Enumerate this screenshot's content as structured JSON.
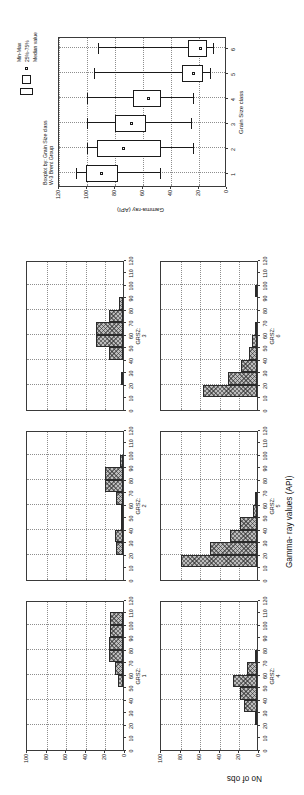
{
  "figure": {
    "orientation": "landscape figure rendered rotated 90 degrees counter-clockwise"
  },
  "histograms": {
    "shared_x_axis_title": "Gamma- ray values (API)",
    "shared_y_axis_title": "No of obs",
    "x_ticks": [
      "0",
      "10",
      "20",
      "30",
      "40",
      "50",
      "60",
      "70",
      "80",
      "90",
      "100",
      "110",
      "120"
    ],
    "y_ticks": [
      "0",
      "20",
      "40",
      "60",
      "80",
      "100"
    ],
    "panels": [
      {
        "label_line1": "GRSZ:",
        "label_line2": "1",
        "name": "grsz-1"
      },
      {
        "label_line1": "GRSZ:",
        "label_line2": "2",
        "name": "grsz-2"
      },
      {
        "label_line1": "GRSZ:",
        "label_line2": "3",
        "name": "grsz-3"
      },
      {
        "label_line1": "GRSZ:",
        "label_line2": "4",
        "name": "grsz-4"
      },
      {
        "label_line1": "GRSZ:",
        "label_line2": "5",
        "name": "grsz-5"
      },
      {
        "label_line1": "GRSZ:",
        "label_line2": "6",
        "name": "grsz-6"
      }
    ]
  },
  "boxplot": {
    "title_line1": "Boxplot by: Grain Size class",
    "title_line2": "W-3 Brent Group",
    "y_axis_title": "Gamma-ray (API)",
    "x_axis_title": "Grain Size class",
    "y_ticks": [
      "0",
      "20",
      "40",
      "60",
      "80",
      "100",
      "120"
    ],
    "x_ticks": [
      "1",
      "2",
      "3",
      "4",
      "5",
      "6"
    ],
    "legend": {
      "minmax_label": "Min-Max",
      "iqr_label": "25%-75%",
      "median_label": "Median value"
    }
  },
  "chart_data": [
    {
      "type": "bar",
      "name": "grsz-1",
      "title": "GRSZ: 1",
      "xlabel": "Gamma- ray values (API)",
      "ylabel": "No of obs",
      "xlim": [
        0,
        120
      ],
      "ylim": [
        0,
        100
      ],
      "grid": true,
      "bin_width": 10,
      "bin_starts": [
        0,
        10,
        20,
        30,
        40,
        50,
        60,
        70,
        80,
        90,
        100,
        110
      ],
      "categories": [
        "0-10",
        "10-20",
        "20-30",
        "30-40",
        "40-50",
        "50-60",
        "60-70",
        "70-80",
        "80-90",
        "90-100",
        "100-110",
        "110-120"
      ],
      "values": [
        0,
        0,
        0,
        0,
        0,
        5,
        8,
        14,
        14,
        13,
        13,
        0
      ]
    },
    {
      "type": "bar",
      "name": "grsz-2",
      "title": "GRSZ: 2",
      "xlabel": "Gamma- ray values (API)",
      "ylabel": "No of obs",
      "xlim": [
        0,
        120
      ],
      "ylim": [
        0,
        100
      ],
      "grid": true,
      "bin_width": 10,
      "bin_starts": [
        0,
        10,
        20,
        30,
        40,
        50,
        60,
        70,
        80,
        90,
        100,
        110
      ],
      "categories": [
        "0-10",
        "10-20",
        "20-30",
        "30-40",
        "40-50",
        "50-60",
        "60-70",
        "70-80",
        "80-90",
        "90-100",
        "100-110",
        "110-120"
      ],
      "values": [
        0,
        0,
        7,
        8,
        1,
        2,
        7,
        18,
        18,
        3,
        0,
        0
      ]
    },
    {
      "type": "bar",
      "name": "grsz-3",
      "title": "GRSZ: 3",
      "xlabel": "Gamma- ray values (API)",
      "ylabel": "No of obs",
      "xlim": [
        0,
        120
      ],
      "ylim": [
        0,
        100
      ],
      "grid": true,
      "bin_width": 10,
      "bin_starts": [
        0,
        10,
        20,
        30,
        40,
        50,
        60,
        70,
        80,
        90,
        100,
        110
      ],
      "categories": [
        "0-10",
        "10-20",
        "20-30",
        "30-40",
        "40-50",
        "50-60",
        "60-70",
        "70-80",
        "80-90",
        "90-100",
        "100-110",
        "110-120"
      ],
      "values": [
        0,
        0,
        2,
        0,
        14,
        28,
        28,
        14,
        4,
        0,
        0,
        0
      ]
    },
    {
      "type": "bar",
      "name": "grsz-4",
      "title": "GRSZ: 4",
      "xlabel": "Gamma- ray values (API)",
      "ylabel": "No of obs",
      "xlim": [
        0,
        120
      ],
      "ylim": [
        0,
        100
      ],
      "grid": true,
      "bin_width": 10,
      "bin_starts": [
        0,
        10,
        20,
        30,
        40,
        50,
        60,
        70,
        80,
        90,
        100,
        110
      ],
      "categories": [
        "0-10",
        "10-20",
        "20-30",
        "30-40",
        "40-50",
        "50-60",
        "60-70",
        "70-80",
        "80-90",
        "90-100",
        "100-110",
        "110-120"
      ],
      "values": [
        0,
        0,
        2,
        13,
        17,
        25,
        10,
        2,
        0,
        0,
        0,
        0
      ]
    },
    {
      "type": "bar",
      "name": "grsz-5",
      "title": "GRSZ: 5",
      "xlabel": "Gamma- ray values (API)",
      "ylabel": "No of obs",
      "xlim": [
        0,
        120
      ],
      "ylim": [
        0,
        100
      ],
      "grid": true,
      "bin_width": 10,
      "bin_starts": [
        0,
        10,
        20,
        30,
        40,
        50,
        60,
        70,
        80,
        90,
        100,
        110
      ],
      "categories": [
        "0-10",
        "10-20",
        "20-30",
        "30-40",
        "40-50",
        "50-60",
        "60-70",
        "70-80",
        "80-90",
        "90-100",
        "100-110",
        "110-120"
      ],
      "values": [
        0,
        78,
        48,
        28,
        17,
        4,
        2,
        0,
        0,
        0,
        0,
        0
      ]
    },
    {
      "type": "bar",
      "name": "grsz-6",
      "title": "GRSZ: 6",
      "xlabel": "Gamma- ray values (API)",
      "ylabel": "No of obs",
      "xlim": [
        0,
        120
      ],
      "ylim": [
        0,
        100
      ],
      "grid": true,
      "bin_width": 10,
      "bin_starts": [
        0,
        10,
        20,
        30,
        40,
        50,
        60,
        70,
        80,
        90,
        100,
        110
      ],
      "categories": [
        "0-10",
        "10-20",
        "20-30",
        "30-40",
        "40-50",
        "50-60",
        "60-70",
        "70-80",
        "80-90",
        "90-100",
        "100-110",
        "110-120"
      ],
      "values": [
        0,
        55,
        30,
        16,
        8,
        5,
        2,
        0,
        0,
        2,
        0,
        0
      ]
    },
    {
      "type": "box",
      "name": "boxplot-grain-size",
      "title": "Boxplot by: Grain Size class   W-3 Brent Group",
      "xlabel": "Grain Size class",
      "ylabel": "Gamma-ray (API)",
      "ylim": [
        0,
        120
      ],
      "grid": true,
      "categories": [
        "1",
        "2",
        "3",
        "4",
        "5",
        "6"
      ],
      "boxes": [
        {
          "category": "1",
          "min": 48,
          "q1": 78,
          "median": 90,
          "q3": 101,
          "max": 108
        },
        {
          "category": "2",
          "min": 24,
          "q1": 47,
          "median": 74,
          "q3": 93,
          "max": 100
        },
        {
          "category": "3",
          "min": 26,
          "q1": 58,
          "median": 68,
          "q3": 80,
          "max": 100
        },
        {
          "category": "4",
          "min": 24,
          "q1": 47,
          "median": 56,
          "q3": 67,
          "max": 100
        },
        {
          "category": "5",
          "min": 12,
          "q1": 17,
          "median": 24,
          "q3": 32,
          "max": 95
        },
        {
          "category": "6",
          "min": 10,
          "q1": 14,
          "median": 19,
          "q3": 28,
          "max": 92
        }
      ],
      "legend": {
        "position": "top-right",
        "entries": [
          "Min-Max",
          "25%-75%",
          "Median value"
        ]
      }
    }
  ]
}
